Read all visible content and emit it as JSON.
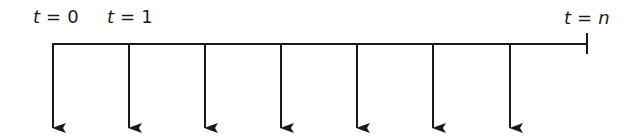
{
  "diagram": {
    "type": "cash-flow timeline",
    "labels": {
      "start": {
        "var": "t",
        "eq": "=",
        "val": "0"
      },
      "first": {
        "var": "t",
        "eq": "=",
        "val": "1"
      },
      "end": {
        "var": "t",
        "eq": "=",
        "val": "n"
      }
    },
    "arrow_count": 7,
    "arrow_direction": "down",
    "line_color": "#1a1a1a"
  }
}
